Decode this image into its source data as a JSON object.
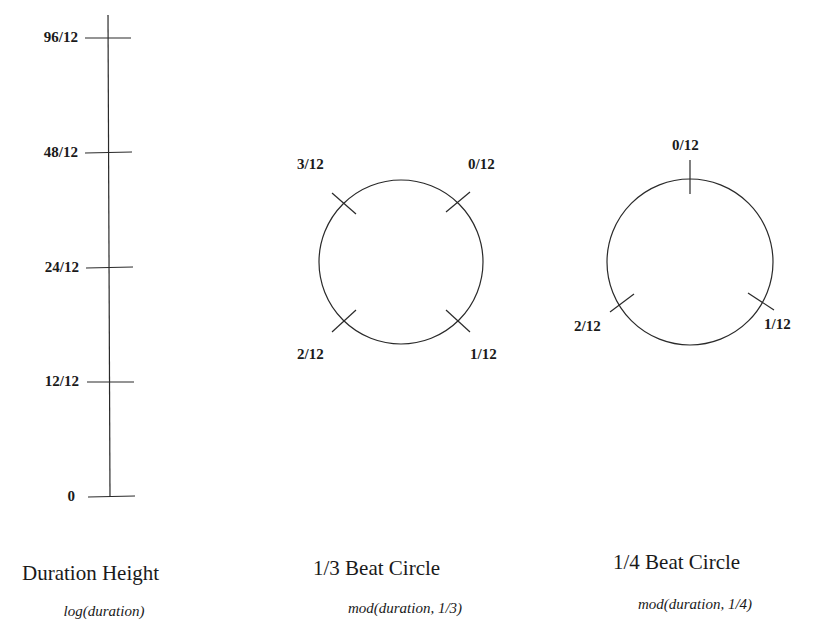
{
  "duration_height": {
    "title": "Duration Height",
    "formula": "log(duration)",
    "ticks": [
      {
        "label": "96/12",
        "y": 38
      },
      {
        "label": "48/12",
        "y": 153
      },
      {
        "label": "24/12",
        "y": 268
      },
      {
        "label": "12/12",
        "y": 382
      },
      {
        "label": "0",
        "y": 496
      }
    ]
  },
  "beat_circle_third": {
    "title": "1/3 Beat Circle",
    "formula": "mod(duration, 1/3)",
    "labels": [
      "0/12",
      "1/12",
      "2/12",
      "3/12"
    ]
  },
  "beat_circle_quarter": {
    "title": "1/4 Beat Circle",
    "formula": "mod(duration, 1/4)",
    "labels": [
      "0/12",
      "1/12",
      "2/12"
    ]
  },
  "colors": {
    "ink": "#1a1a1a",
    "background": "#ffffff"
  }
}
